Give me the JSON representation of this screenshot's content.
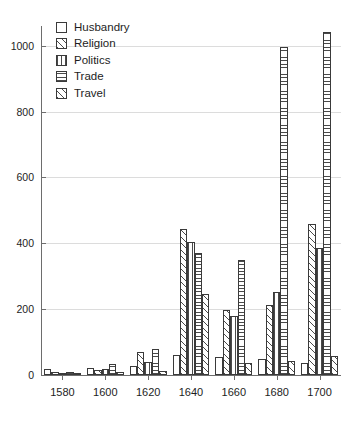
{
  "chart_data": {
    "type": "bar",
    "title": "",
    "xlabel": "",
    "ylabel": "",
    "ylim": [
      0,
      1060
    ],
    "yticks": [
      0,
      200,
      400,
      600,
      800,
      1000
    ],
    "grid": true,
    "legend_position": "top-left",
    "categories": [
      "1580",
      "1600",
      "1620",
      "1640",
      "1660",
      "1680",
      "1700"
    ],
    "series": [
      {
        "name": "Husbandry",
        "pattern": "empty",
        "values": [
          18,
          22,
          28,
          62,
          55,
          48,
          38
        ]
      },
      {
        "name": "Religion",
        "pattern": "diagonal",
        "values": [
          10,
          14,
          70,
          443,
          198,
          212,
          458
        ]
      },
      {
        "name": "Politics",
        "pattern": "vertical",
        "values": [
          6,
          18,
          40,
          405,
          178,
          252,
          385
        ]
      },
      {
        "name": "Trade",
        "pattern": "horizontal",
        "values": [
          8,
          34,
          78,
          370,
          350,
          995,
          1043
        ]
      },
      {
        "name": "Travel",
        "pattern": "diagonal",
        "values": [
          3,
          8,
          12,
          245,
          36,
          42,
          58
        ]
      }
    ]
  },
  "legend": {
    "items": [
      {
        "label": "Husbandry"
      },
      {
        "label": "Religion"
      },
      {
        "label": "Politics"
      },
      {
        "label": "Trade"
      },
      {
        "label": "Travel"
      }
    ]
  },
  "axes": {
    "y_labels": [
      "1000",
      "800",
      "600",
      "400",
      "200",
      "0"
    ],
    "x_labels": [
      "1580",
      "1600",
      "1620",
      "1640",
      "1660",
      "1680",
      "1700"
    ]
  },
  "colors": {
    "axis": "#6d6d6d",
    "grid": "#dcdcdc",
    "ink": "#3a3a3a",
    "text": "#1d1d1d",
    "background": "#ffffff"
  }
}
